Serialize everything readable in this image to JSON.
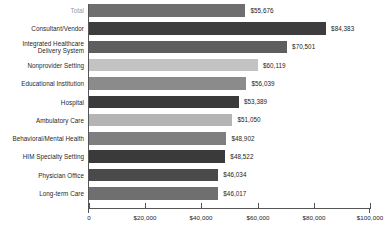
{
  "chart_data": {
    "type": "bar",
    "orientation": "horizontal",
    "title": "",
    "subtitle": "",
    "xlabel": "",
    "ylabel": "",
    "xlim": [
      0,
      100000
    ],
    "grid": false,
    "legend": null,
    "axis": {
      "tick_values": [
        0,
        20000,
        40000,
        60000,
        80000,
        100000
      ],
      "tick_labels": [
        "0",
        "$20,000",
        "$40,000",
        "$60,000",
        "$80,000",
        "$100,000"
      ]
    },
    "categories": [
      "Total",
      "Consultant/Vendor",
      "Integrated Healthcare\nDelivery System",
      "Nonprovider Setting",
      "Educational Institution",
      "Hospital",
      "Ambulatory Care",
      "Behavioral/Mental Health",
      "HIM Specialty Setting",
      "Physician Office",
      "Long-term Care"
    ],
    "values": [
      55676,
      84383,
      70501,
      60119,
      56039,
      53389,
      51050,
      48902,
      48522,
      46034,
      46017
    ],
    "value_labels": [
      "$55,676",
      "$84,383",
      "$70,501",
      "$60,119",
      "$56,039",
      "$53,389",
      "$51,050",
      "$48,902",
      "$48,522",
      "$46,034",
      "$46,017"
    ],
    "bar_colors": [
      "#6e6e6e",
      "#3d3d3d",
      "#5e5e5e",
      "#c3c3c3",
      "#8b8b8b",
      "#3a3a3a",
      "#b4b4b4",
      "#7f7f7f",
      "#3a3a3a",
      "#4a4a4a",
      "#6f6f6f"
    ],
    "label_colors": [
      "#9a9a9a",
      "#1f1f1f",
      "#1f1f1f",
      "#1f1f1f",
      "#1f1f1f",
      "#1f1f1f",
      "#1f1f1f",
      "#1f1f1f",
      "#1f1f1f",
      "#1f1f1f",
      "#1f1f1f"
    ]
  }
}
